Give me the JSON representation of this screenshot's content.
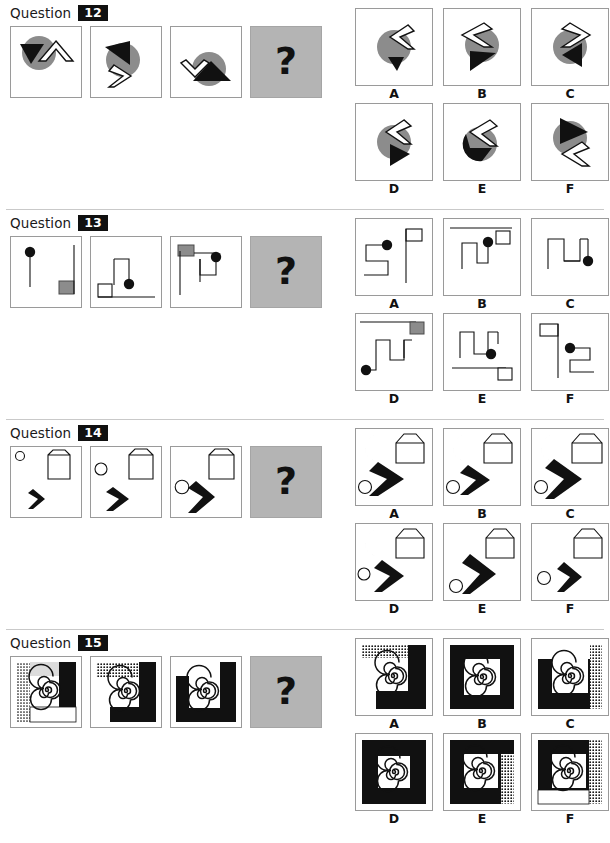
{
  "page": {
    "width": 610,
    "height": 843,
    "type": "non-verbal-reasoning-test",
    "question_word": "Question",
    "missing_cell_glyph": "?",
    "colors": {
      "gray_fill": "#8c8c8c",
      "black_fill": "#111111",
      "white_fill": "#ffffff",
      "panel_border": "#9a9a9a",
      "qmark_panel": "#b4b4b4",
      "badge_bg": "#101010",
      "badge_text": "#ffffff",
      "divider": "#c9c9c9"
    }
  },
  "questions": [
    {
      "number": "12",
      "description": "Gray circle with black triangle and white outlined chevron arrow",
      "stimulus": [
        {
          "name": "stimulus-1",
          "figure": "circle-triangle-chevron-up"
        },
        {
          "name": "stimulus-2",
          "figure": "circle-triangle-chevron-right"
        },
        {
          "name": "stimulus-3",
          "figure": "circle-triangle-chevron-down"
        },
        {
          "name": "stimulus-missing",
          "figure": "question-mark"
        }
      ],
      "options": [
        {
          "label": "A",
          "figure": "circle-chevron-left-small-triangle"
        },
        {
          "label": "B",
          "figure": "circle-chevron-left-big-triangle"
        },
        {
          "label": "C",
          "figure": "circle-chevron-right-triangle-left"
        },
        {
          "label": "D",
          "figure": "circle-chevron-left-triangle-right"
        },
        {
          "label": "E",
          "figure": "black-circle-chevron-left-gray-tail"
        },
        {
          "label": "F",
          "figure": "circle-triangle-top-chevron-bottom"
        }
      ]
    },
    {
      "number": "13",
      "description": "Zig-zag line paths with black dot and gray or white square",
      "stimulus": [
        {
          "name": "stimulus-1",
          "figure": "vertical-line-dot-gray-square"
        },
        {
          "name": "stimulus-2",
          "figure": "hook-line-dot-white-square"
        },
        {
          "name": "stimulus-3",
          "figure": "double-hook-dot-gray-square"
        },
        {
          "name": "stimulus-missing",
          "figure": "question-mark"
        }
      ],
      "options": [
        {
          "label": "A",
          "figure": "s-path-dot-white-square-right"
        },
        {
          "label": "B",
          "figure": "u-path-dot-white-square-topright"
        },
        {
          "label": "C",
          "figure": "m-path-dot-right"
        },
        {
          "label": "D",
          "figure": "m-path-dot-left-gray-square"
        },
        {
          "label": "E",
          "figure": "m-path-dot-white-square-bottomright"
        },
        {
          "label": "F",
          "figure": "s-path-dot-white-square-topleft"
        }
      ]
    },
    {
      "number": "14",
      "description": "Gray crescent moon, white pentagon house, small circle and black chevron",
      "stimulus": [
        {
          "name": "stimulus-1",
          "figure": "moon-house-small-circle-small-chevron"
        },
        {
          "name": "stimulus-2",
          "figure": "moon-house-mid-circle-mid-chevron"
        },
        {
          "name": "stimulus-3",
          "figure": "moon-house-large-circle-large-chevron"
        },
        {
          "name": "stimulus-missing",
          "figure": "question-mark"
        }
      ],
      "options": [
        {
          "label": "A",
          "figure": "small-moon-house-circle-large-chevron"
        },
        {
          "label": "B",
          "figure": "small-moon-house-circle-mid-chevron"
        },
        {
          "label": "C",
          "figure": "small-moon-house-circle-tall-chevron"
        },
        {
          "label": "D",
          "figure": "small-moon-house-small-circle-chevron"
        },
        {
          "label": "E",
          "figure": "large-moon-house-circle-tall-chevron"
        },
        {
          "label": "F",
          "figure": "large-moon-house-circle-small-chevron"
        }
      ]
    },
    {
      "number": "15",
      "description": "Spiral inside nested square frames with black, white and dotted shading",
      "stimulus": [
        {
          "name": "stimulus-1",
          "figure": "spiral-light-top-dotted-left-white-bottom"
        },
        {
          "name": "stimulus-2",
          "figure": "spiral-dotted-top-white-left-black-right"
        },
        {
          "name": "stimulus-3",
          "figure": "spiral-white-top-black-frame"
        },
        {
          "name": "stimulus-missing",
          "figure": "question-mark"
        }
      ],
      "options": [
        {
          "label": "A",
          "figure": "spiral-dotted-top-white-left-black"
        },
        {
          "label": "B",
          "figure": "spiral-full-black-frame"
        },
        {
          "label": "C",
          "figure": "spiral-white-top-dotted-right-black"
        },
        {
          "label": "D",
          "figure": "spiral-full-black-frame-thick"
        },
        {
          "label": "E",
          "figure": "spiral-black-frame-dotted-right"
        },
        {
          "label": "F",
          "figure": "spiral-black-top-dotted-right-white-bottom"
        }
      ]
    }
  ]
}
